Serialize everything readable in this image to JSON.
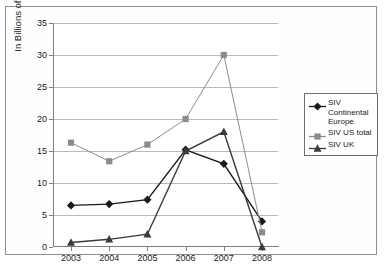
{
  "chart_data": {
    "type": "line",
    "title": "",
    "xlabel": "",
    "ylabel": "In Billions of Dollars",
    "categories": [
      "2003",
      "2004",
      "2005",
      "2006",
      "2007",
      "2008"
    ],
    "ylim": [
      0,
      35
    ],
    "ytick_step": 5,
    "yticks": [
      "0",
      "5",
      "10",
      "15",
      "20",
      "25",
      "30",
      "35"
    ],
    "grid": true,
    "legend_position": "right",
    "series": [
      {
        "name": "SIV Continental Europe",
        "marker": "diamond",
        "color": "#1a1a1a",
        "values": [
          6.5,
          6.7,
          7.4,
          15.2,
          13.0,
          4.0
        ]
      },
      {
        "name": "SIV US total",
        "marker": "square",
        "color": "#8c8c8c",
        "values": [
          16.3,
          13.4,
          16.0,
          20.0,
          30.0,
          2.3
        ]
      },
      {
        "name": "SIV UK",
        "marker": "triangle",
        "color": "#3a3a3a",
        "values": [
          0.7,
          1.2,
          2.0,
          15.0,
          18.0,
          0.0
        ]
      }
    ]
  },
  "legend": {
    "entries": [
      {
        "label_line1": "SIV",
        "label_line2": "Continental",
        "label_line3": "Europe"
      },
      {
        "label_line1": "SIV US total"
      },
      {
        "label_line1": "SIV UK"
      }
    ]
  }
}
